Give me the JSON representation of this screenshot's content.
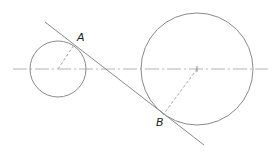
{
  "diagram": {
    "colors": {
      "stroke": "#8a8a8a",
      "centerline": "#b5b5b5",
      "label": "#222222"
    },
    "small_circle": {
      "cx": 58,
      "cy": 69,
      "r": 28
    },
    "large_circle": {
      "cx": 197,
      "cy": 69,
      "r": 56
    },
    "centerline": {
      "x1": 13,
      "y1": 69,
      "x2": 268,
      "y2": 69
    },
    "tangent_line": {
      "x1": 45,
      "y1": 22,
      "x2": 204,
      "y2": 145
    },
    "points": [
      {
        "label": "A",
        "x": 74,
        "y": 45,
        "lx": 78,
        "ly": 41
      },
      {
        "label": "B",
        "x": 163,
        "y": 115,
        "lx": 156,
        "ly": 126
      }
    ]
  }
}
